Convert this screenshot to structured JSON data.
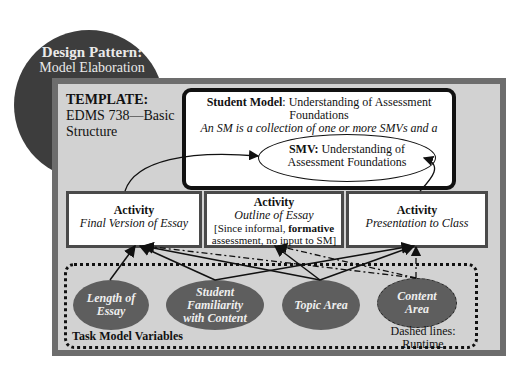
{
  "badge": {
    "title": "Design Pattern:",
    "subtitle": "Model Elaboration"
  },
  "template": {
    "title": "TEMPLATE:",
    "line1": "EDMS 738—Basic",
    "line2": "Structure"
  },
  "student_model": {
    "label": "Student Model",
    "title_rest": ": Understanding of Assessment Foundations",
    "description_line1": "An SM is a collection of one or more SMVs and a probability",
    "description_line2": "distribution over them"
  },
  "smv": {
    "label": "SMV:",
    "line1_rest": " Understanding of",
    "line2": "Assessment Foundations"
  },
  "activities": [
    {
      "heading": "Activity",
      "subtitle": "Final Version of Essay"
    },
    {
      "heading": "Activity",
      "subtitle": "Outline of Essay",
      "note_pre": "[Since informal, ",
      "note_bold": "formative",
      "note_post": "assessment, no input to SM]"
    },
    {
      "heading": "Activity",
      "subtitle": "Presentation to Class"
    }
  ],
  "task_model": {
    "label": "Task Model Variables",
    "variables": [
      {
        "line1": "Length of",
        "line2": "Essay",
        "line3": ""
      },
      {
        "line1": "Student",
        "line2": "Familiarity",
        "line3": "with Content"
      },
      {
        "line1": "Topic Area",
        "line2": "",
        "line3": ""
      },
      {
        "line1": "Content",
        "line2": "Area",
        "line3": ""
      }
    ],
    "note_line1": "Dashed lines:",
    "note_line2": "Runtime"
  },
  "colors": {
    "badge_bg": "#3d3d3d",
    "frame_border": "#6d6d6d",
    "frame_fill": "#d2d2d2",
    "oval_fill": "#5e5e5e"
  }
}
